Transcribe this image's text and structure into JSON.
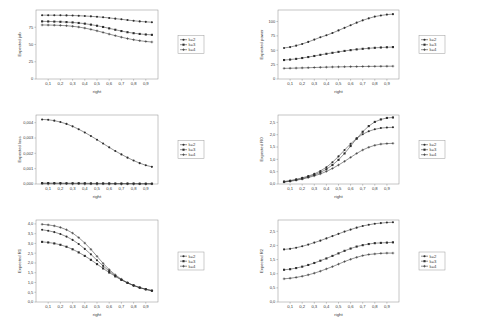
{
  "figure": {
    "background": "#ffffff",
    "axis_color": "#8c8c8c",
    "series_color": "#3a3a3a",
    "marker_color": "#2c2c2c",
    "legend_border": "#9a9a9a",
    "rows": 3,
    "cols": 2
  },
  "legend": {
    "entries": [
      {
        "label": "k=2",
        "marker": "circle"
      },
      {
        "label": "k=3",
        "marker": "square"
      },
      {
        "label": "k=4",
        "marker": "plus"
      }
    ]
  },
  "chart_data": [
    {
      "id": "expected-job",
      "type": "line",
      "position": "top-left",
      "title": "",
      "xlabel": "right",
      "ylabel": "Expected job",
      "xlim": [
        0.0,
        1.0
      ],
      "ylim": [
        0,
        100
      ],
      "xticks": [
        0.1,
        0.2,
        0.3,
        0.4,
        0.5,
        0.6,
        0.7,
        0.8,
        0.9
      ],
      "xticklabels": [
        "0,1",
        "0,2",
        "0,3",
        "0,4",
        "0,5",
        "0,6",
        "0,7",
        "0,8",
        "0,9"
      ],
      "yticks": [
        0,
        25,
        50,
        75
      ],
      "yticklabels": [
        "0",
        "25",
        "50",
        "75"
      ],
      "grid": false,
      "x": [
        0.05,
        0.1,
        0.15,
        0.2,
        0.25,
        0.3,
        0.35,
        0.4,
        0.45,
        0.5,
        0.55,
        0.6,
        0.65,
        0.7,
        0.75,
        0.8,
        0.85,
        0.9,
        0.95
      ],
      "series": [
        {
          "name": "k=2",
          "marker": "circle",
          "values": [
            92.5,
            92.5,
            92.4,
            92.3,
            92.2,
            92.0,
            91.7,
            91.3,
            90.8,
            90.2,
            89.4,
            88.5,
            87.5,
            86.5,
            85.4,
            84.4,
            83.5,
            82.8,
            82.3
          ]
        },
        {
          "name": "k=3",
          "marker": "square",
          "values": [
            83.5,
            83.4,
            83.2,
            82.9,
            82.5,
            82.0,
            81.2,
            80.2,
            78.8,
            77.2,
            75.4,
            73.4,
            71.4,
            69.5,
            67.8,
            66.4,
            65.3,
            64.5,
            64.0
          ]
        },
        {
          "name": "k=4",
          "marker": "plus",
          "values": [
            78.3,
            78.2,
            78.0,
            77.7,
            77.2,
            76.4,
            75.3,
            73.8,
            71.9,
            69.8,
            67.5,
            65.1,
            62.8,
            60.6,
            58.6,
            56.9,
            55.5,
            54.4,
            53.6
          ]
        }
      ]
    },
    {
      "id": "expected-power",
      "type": "line",
      "position": "top-right",
      "title": "",
      "xlabel": "right",
      "ylabel": "Expected power",
      "xlim": [
        0.0,
        1.0
      ],
      "ylim": [
        0,
        120
      ],
      "xticks": [
        0.1,
        0.2,
        0.3,
        0.4,
        0.5,
        0.6,
        0.7,
        0.8,
        0.9
      ],
      "xticklabels": [
        "0,1",
        "0,2",
        "0,3",
        "0,4",
        "0,5",
        "0,6",
        "0,7",
        "0,8",
        "0,9"
      ],
      "yticks": [
        0,
        25,
        50,
        75,
        100
      ],
      "yticklabels": [
        "0",
        "25",
        "50",
        "75",
        "100"
      ],
      "grid": false,
      "x": [
        0.05,
        0.1,
        0.15,
        0.2,
        0.25,
        0.3,
        0.35,
        0.4,
        0.45,
        0.5,
        0.55,
        0.6,
        0.65,
        0.7,
        0.75,
        0.8,
        0.85,
        0.9,
        0.95
      ],
      "series": [
        {
          "name": "k=2",
          "marker": "circle",
          "values": [
            54.0,
            55.5,
            58.0,
            61.0,
            64.5,
            68.5,
            72.5,
            76.0,
            80.0,
            84.5,
            89.0,
            93.5,
            98.0,
            102.0,
            105.5,
            108.5,
            110.5,
            112.0,
            112.8
          ]
        },
        {
          "name": "k=3",
          "marker": "square",
          "values": [
            33.0,
            33.8,
            35.0,
            36.5,
            38.2,
            40.0,
            42.0,
            43.8,
            45.5,
            47.2,
            48.8,
            50.2,
            51.5,
            52.5,
            53.4,
            54.2,
            54.8,
            55.2,
            55.5
          ]
        },
        {
          "name": "k=4",
          "marker": "plus",
          "values": [
            18.5,
            18.7,
            19.0,
            19.3,
            19.6,
            20.0,
            20.3,
            20.6,
            20.9,
            21.1,
            21.3,
            21.5,
            21.6,
            21.8,
            21.9,
            22.0,
            22.1,
            22.2,
            22.3
          ]
        }
      ]
    },
    {
      "id": "expected-loss",
      "type": "line",
      "position": "middle-left",
      "title": "",
      "xlabel": "right",
      "ylabel": "Expected loss",
      "xlim": [
        0.0,
        1.0
      ],
      "ylim": [
        0.0,
        0.0045
      ],
      "xticks": [
        0.1,
        0.2,
        0.3,
        0.4,
        0.5,
        0.6,
        0.7,
        0.8,
        0.9
      ],
      "xticklabels": [
        "0,1",
        "0,2",
        "0,3",
        "0,4",
        "0,5",
        "0,6",
        "0,7",
        "0,8",
        "0,9"
      ],
      "yticks": [
        0.0,
        0.001,
        0.002,
        0.003,
        0.004
      ],
      "yticklabels": [
        "0,000",
        "0,001",
        "0,002",
        "0,003",
        "0,004"
      ],
      "grid": false,
      "x": [
        0.05,
        0.1,
        0.15,
        0.2,
        0.25,
        0.3,
        0.35,
        0.4,
        0.45,
        0.5,
        0.55,
        0.6,
        0.65,
        0.7,
        0.75,
        0.8,
        0.85,
        0.9,
        0.95
      ],
      "series": [
        {
          "name": "k=2",
          "marker": "circle",
          "values": [
            0.00421,
            0.00419,
            0.00413,
            0.00404,
            0.00392,
            0.00376,
            0.00357,
            0.00336,
            0.00313,
            0.00289,
            0.00264,
            0.00239,
            0.00215,
            0.00193,
            0.00172,
            0.00153,
            0.00136,
            0.00122,
            0.00112
          ]
        },
        {
          "name": "k=3",
          "marker": "square",
          "values": [
            6e-05,
            6e-05,
            6e-05,
            6e-05,
            5e-05,
            5e-05,
            5e-05,
            5e-05,
            4e-05,
            4e-05,
            4e-05,
            4e-05,
            3e-05,
            3e-05,
            3e-05,
            3e-05,
            2e-05,
            2e-05,
            2e-05
          ]
        },
        {
          "name": "k=4",
          "marker": "plus",
          "values": [
            2e-05,
            2e-05,
            2e-05,
            2e-05,
            2e-05,
            2e-05,
            2e-05,
            1e-05,
            1e-05,
            1e-05,
            1e-05,
            1e-05,
            1e-05,
            1e-05,
            1e-05,
            1e-05,
            1e-05,
            1e-05,
            1e-05
          ]
        }
      ]
    },
    {
      "id": "expected-r0",
      "type": "line",
      "position": "middle-right",
      "title": "",
      "xlabel": "right",
      "ylabel": "Expected R0",
      "xlim": [
        0.0,
        1.0
      ],
      "ylim": [
        0.0,
        2.8
      ],
      "xticks": [
        0.1,
        0.2,
        0.3,
        0.4,
        0.5,
        0.6,
        0.7,
        0.8,
        0.9
      ],
      "xticklabels": [
        "0,1",
        "0,2",
        "0,3",
        "0,4",
        "0,5",
        "0,6",
        "0,7",
        "0,8",
        "0,9"
      ],
      "yticks": [
        0.0,
        0.5,
        1.0,
        1.5,
        2.0,
        2.5
      ],
      "yticklabels": [
        "0,0",
        "0,5",
        "1,0",
        "1,5",
        "2,0",
        "2,5"
      ],
      "grid": false,
      "x": [
        0.05,
        0.1,
        0.15,
        0.2,
        0.25,
        0.3,
        0.35,
        0.4,
        0.45,
        0.5,
        0.55,
        0.6,
        0.65,
        0.7,
        0.75,
        0.8,
        0.85,
        0.9,
        0.95
      ],
      "series": [
        {
          "name": "k=2",
          "marker": "circle",
          "values": [
            0.1,
            0.14,
            0.19,
            0.25,
            0.32,
            0.41,
            0.53,
            0.68,
            0.88,
            1.12,
            1.38,
            1.63,
            1.85,
            2.02,
            2.14,
            2.22,
            2.27,
            2.29,
            2.3
          ]
        },
        {
          "name": "k=3",
          "marker": "square",
          "values": [
            0.09,
            0.12,
            0.17,
            0.22,
            0.29,
            0.37,
            0.47,
            0.6,
            0.77,
            0.98,
            1.24,
            1.54,
            1.84,
            2.12,
            2.35,
            2.52,
            2.62,
            2.68,
            2.7
          ]
        },
        {
          "name": "k=4",
          "marker": "plus",
          "values": [
            0.08,
            0.11,
            0.15,
            0.2,
            0.26,
            0.33,
            0.41,
            0.51,
            0.63,
            0.77,
            0.92,
            1.08,
            1.24,
            1.38,
            1.49,
            1.57,
            1.62,
            1.64,
            1.65
          ]
        }
      ]
    },
    {
      "id": "expected-r1",
      "type": "line",
      "position": "bottom-left",
      "title": "",
      "xlabel": "right",
      "ylabel": "Expected R1",
      "xlim": [
        0.0,
        1.0
      ],
      "ylim": [
        0.0,
        4.2
      ],
      "xticks": [
        0.1,
        0.2,
        0.3,
        0.4,
        0.5,
        0.6,
        0.7,
        0.8,
        0.9
      ],
      "xticklabels": [
        "0,1",
        "0,2",
        "0,3",
        "0,4",
        "0,5",
        "0,6",
        "0,7",
        "0,8",
        "0,9"
      ],
      "yticks": [
        0.0,
        0.5,
        1.0,
        1.5,
        2.0,
        2.5,
        3.0,
        3.5,
        4.0
      ],
      "yticklabels": [
        "0,0",
        "0,5",
        "1,0",
        "1,5",
        "2,0",
        "2,5",
        "3,0",
        "3,5",
        "4,0"
      ],
      "grid": false,
      "x": [
        0.05,
        0.1,
        0.15,
        0.2,
        0.25,
        0.3,
        0.35,
        0.4,
        0.45,
        0.5,
        0.55,
        0.6,
        0.65,
        0.7,
        0.75,
        0.8,
        0.85,
        0.9,
        0.95
      ],
      "series": [
        {
          "name": "k=2",
          "marker": "circle",
          "values": [
            3.7,
            3.65,
            3.58,
            3.48,
            3.35,
            3.18,
            2.97,
            2.72,
            2.44,
            2.14,
            1.85,
            1.58,
            1.34,
            1.14,
            0.97,
            0.84,
            0.73,
            0.65,
            0.58
          ]
        },
        {
          "name": "k=3",
          "marker": "square",
          "values": [
            3.08,
            3.05,
            3.0,
            2.93,
            2.83,
            2.7,
            2.54,
            2.36,
            2.16,
            1.94,
            1.72,
            1.51,
            1.31,
            1.13,
            0.98,
            0.85,
            0.74,
            0.65,
            0.58
          ]
        },
        {
          "name": "k=4",
          "marker": "plus",
          "values": [
            3.98,
            3.95,
            3.9,
            3.82,
            3.7,
            3.53,
            3.3,
            3.02,
            2.7,
            2.34,
            1.98,
            1.66,
            1.39,
            1.17,
            0.99,
            0.85,
            0.74,
            0.65,
            0.58
          ]
        }
      ]
    },
    {
      "id": "expected-r2",
      "type": "line",
      "position": "bottom-right",
      "title": "",
      "xlabel": "right",
      "ylabel": "Expected R2",
      "xlim": [
        0.0,
        1.0
      ],
      "ylim": [
        0.0,
        2.9
      ],
      "xticks": [
        0.1,
        0.2,
        0.3,
        0.4,
        0.5,
        0.6,
        0.7,
        0.8,
        0.9
      ],
      "xticklabels": [
        "0,1",
        "0,2",
        "0,3",
        "0,4",
        "0,5",
        "0,6",
        "0,7",
        "0,8",
        "0,9"
      ],
      "yticks": [
        0.0,
        0.5,
        1.0,
        1.5,
        2.0,
        2.5
      ],
      "yticklabels": [
        "0,0",
        "0,5",
        "1,0",
        "1,5",
        "2,0",
        "2,5"
      ],
      "grid": false,
      "x": [
        0.05,
        0.1,
        0.15,
        0.2,
        0.25,
        0.3,
        0.35,
        0.4,
        0.45,
        0.5,
        0.55,
        0.6,
        0.65,
        0.7,
        0.75,
        0.8,
        0.85,
        0.9,
        0.95
      ],
      "series": [
        {
          "name": "k=2",
          "marker": "circle",
          "values": [
            1.86,
            1.88,
            1.92,
            1.97,
            2.03,
            2.1,
            2.17,
            2.25,
            2.33,
            2.41,
            2.49,
            2.56,
            2.63,
            2.69,
            2.73,
            2.77,
            2.79,
            2.81,
            2.82
          ]
        },
        {
          "name": "k=3",
          "marker": "square",
          "values": [
            1.14,
            1.16,
            1.2,
            1.25,
            1.31,
            1.38,
            1.46,
            1.54,
            1.63,
            1.72,
            1.81,
            1.89,
            1.96,
            2.01,
            2.05,
            2.08,
            2.09,
            2.1,
            2.11
          ]
        },
        {
          "name": "k=4",
          "marker": "plus",
          "values": [
            0.82,
            0.84,
            0.87,
            0.91,
            0.96,
            1.02,
            1.09,
            1.17,
            1.25,
            1.34,
            1.43,
            1.51,
            1.58,
            1.64,
            1.68,
            1.7,
            1.72,
            1.73,
            1.73
          ]
        }
      ]
    }
  ]
}
